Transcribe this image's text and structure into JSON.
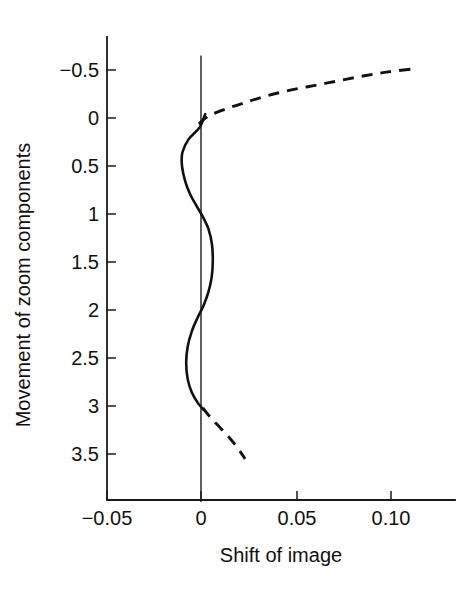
{
  "chart_data": {
    "type": "line",
    "title": "",
    "xlabel": "Shift of image",
    "ylabel": "Movement of zoom components",
    "xlim": [
      -0.062,
      0.125
    ],
    "ylim": [
      -0.72,
      4.05
    ],
    "y_axis_inverted": true,
    "grid": false,
    "legend": "none",
    "xticks": [
      -0.05,
      0,
      0.05,
      0.1
    ],
    "xticklabels": [
      "−0.05",
      "0",
      "0.05",
      "0.10"
    ],
    "yticks": [
      -0.5,
      0,
      0.5,
      1,
      1.5,
      2,
      2.5,
      3,
      3.5
    ],
    "yticklabels": [
      "−0.5",
      "0",
      "0.5",
      "1",
      "1.5",
      "2",
      "2.5",
      "3",
      "3.5"
    ],
    "reference_line": {
      "name": "zero-reference-line",
      "x": 0,
      "y_from": -0.65,
      "y_to": 4.0,
      "style": "solid"
    },
    "series": [
      {
        "name": "solid-oscillating-branch",
        "style": "solid",
        "points": [
          [
            0.0022,
            -0.04
          ],
          [
            -0.0008,
            0.1
          ],
          [
            -0.0065,
            0.22
          ],
          [
            -0.0098,
            0.36
          ],
          [
            -0.01,
            0.5
          ],
          [
            -0.0083,
            0.66
          ],
          [
            -0.0056,
            0.8
          ],
          [
            -0.0022,
            0.92
          ],
          [
            0.001,
            1.03
          ],
          [
            0.004,
            1.16
          ],
          [
            0.0058,
            1.32
          ],
          [
            0.0062,
            1.5
          ],
          [
            0.0056,
            1.66
          ],
          [
            0.0038,
            1.82
          ],
          [
            0.0012,
            1.96
          ],
          [
            -0.0018,
            2.08
          ],
          [
            -0.0048,
            2.22
          ],
          [
            -0.007,
            2.38
          ],
          [
            -0.0078,
            2.55
          ],
          [
            -0.007,
            2.72
          ],
          [
            -0.0048,
            2.86
          ],
          [
            -0.0016,
            2.97
          ],
          [
            0.0014,
            3.04
          ]
        ]
      },
      {
        "name": "dashed-upper-branch",
        "style": "dashed",
        "points": [
          [
            -0.0012,
            0.06
          ],
          [
            0.004,
            -0.02
          ],
          [
            0.0125,
            -0.09
          ],
          [
            0.023,
            -0.16
          ],
          [
            0.0345,
            -0.23
          ],
          [
            0.047,
            -0.29
          ],
          [
            0.06,
            -0.34
          ],
          [
            0.073,
            -0.39
          ],
          [
            0.086,
            -0.44
          ],
          [
            0.0985,
            -0.48
          ],
          [
            0.111,
            -0.51
          ]
        ]
      },
      {
        "name": "dashed-lower-branch",
        "style": "dashed",
        "points": [
          [
            0.001,
            3.02
          ],
          [
            0.005,
            3.12
          ],
          [
            0.0098,
            3.22
          ],
          [
            0.0145,
            3.32
          ],
          [
            0.019,
            3.43
          ],
          [
            0.0232,
            3.55
          ]
        ]
      }
    ]
  },
  "axes": {
    "x_title": "Shift of image",
    "y_title": "Movement of zoom components"
  },
  "colors": {
    "ink": "#111111",
    "background": "#ffffff"
  }
}
